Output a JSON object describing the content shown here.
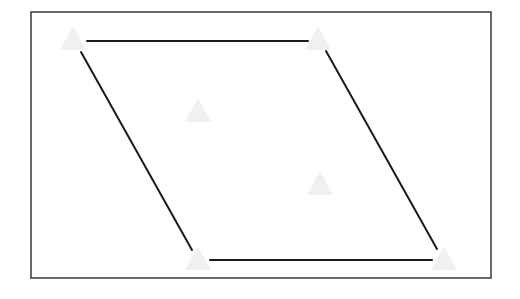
{
  "diagram": {
    "type": "parallelogram",
    "background": "#ffffff",
    "frame": {
      "x": 31,
      "y": 12,
      "width": 460,
      "height": 266,
      "stroke": "#3a3a3a",
      "stroke_width": 1.5
    },
    "edges": [
      {
        "name": "top-edge",
        "x1": 87,
        "y1": 41,
        "x2": 308,
        "y2": 41
      },
      {
        "name": "right-edge",
        "x1": 326,
        "y1": 51,
        "x2": 437,
        "y2": 249
      },
      {
        "name": "bottom-edge",
        "x1": 210,
        "y1": 260,
        "x2": 432,
        "y2": 260
      },
      {
        "name": "left-edge",
        "x1": 81,
        "y1": 52,
        "x2": 192,
        "y2": 250
      }
    ],
    "edge_style": {
      "stroke": "#1a1a1a",
      "stroke_width": 2
    },
    "markers": [
      {
        "name": "top-left-vertex-marker",
        "cx": 73,
        "cy": 38
      },
      {
        "name": "top-right-vertex-marker",
        "cx": 318,
        "cy": 38
      },
      {
        "name": "interior-marker-1",
        "cx": 198,
        "cy": 110
      },
      {
        "name": "interior-marker-2",
        "cx": 320,
        "cy": 183
      },
      {
        "name": "bottom-left-vertex-marker",
        "cx": 198,
        "cy": 258
      },
      {
        "name": "bottom-right-vertex-marker",
        "cx": 444,
        "cy": 258
      }
    ],
    "marker_style": {
      "shape": "triangle",
      "size": 26,
      "fill": "#ececec",
      "opacity": 0.8
    }
  }
}
